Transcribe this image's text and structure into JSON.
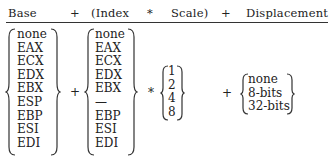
{
  "header": {
    "base": "Base",
    "plus1": "+",
    "index": "(Index",
    "times": "*",
    "scale": "Scale)",
    "plus2": "+",
    "displacement": "Displacement"
  },
  "base_registers": [
    "none",
    "EAX",
    "ECX",
    "EDX",
    "EBX",
    "ESP",
    "EBP",
    "ESI",
    "EDI"
  ],
  "index_registers": [
    "none",
    "EAX",
    "ECX",
    "EDX",
    "EBX",
    "—",
    "EBP",
    "ESI",
    "EDI"
  ],
  "scale_factors": [
    "1",
    "2",
    "4",
    "8"
  ],
  "displacement_options": [
    "none",
    "8-bits",
    "32-bits"
  ],
  "operators": {
    "plus_a": "+",
    "times": "*",
    "plus_b": "+"
  }
}
